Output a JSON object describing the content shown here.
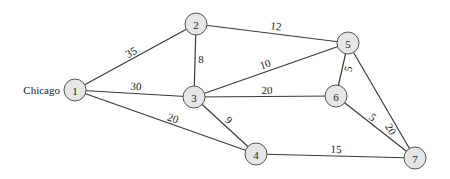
{
  "diagram": {
    "type": "weighted-undirected-graph",
    "node_radius": 11,
    "colors": {
      "node_fill": "#e6e6e6",
      "node_stroke": "#555555",
      "edge": "#3a3a3a",
      "text": "#222222"
    },
    "nodes": [
      {
        "id": "1",
        "label": "1",
        "x": 75,
        "y": 90,
        "name": "Chicago"
      },
      {
        "id": "2",
        "label": "2",
        "x": 196,
        "y": 24
      },
      {
        "id": "3",
        "label": "3",
        "x": 194,
        "y": 97
      },
      {
        "id": "4",
        "label": "4",
        "x": 256,
        "y": 154
      },
      {
        "id": "5",
        "label": "5",
        "x": 348,
        "y": 43
      },
      {
        "id": "6",
        "label": "6",
        "x": 336,
        "y": 96
      },
      {
        "id": "7",
        "label": "7",
        "x": 415,
        "y": 158
      }
    ],
    "edges": [
      {
        "from": "1",
        "to": "2",
        "weight": "35",
        "lx": 131,
        "ly": 52
      },
      {
        "from": "1",
        "to": "3",
        "weight": "30",
        "lx": 136,
        "ly": 86
      },
      {
        "from": "1",
        "to": "4",
        "weight": "20",
        "lx": 173,
        "ly": 118
      },
      {
        "from": "2",
        "to": "3",
        "weight": "8",
        "lx": 201,
        "ly": 59
      },
      {
        "from": "2",
        "to": "5",
        "weight": "12",
        "lx": 276,
        "ly": 26
      },
      {
        "from": "3",
        "to": "5",
        "weight": "10",
        "lx": 265,
        "ly": 64
      },
      {
        "from": "3",
        "to": "6",
        "weight": "20",
        "lx": 267,
        "ly": 90
      },
      {
        "from": "3",
        "to": "4",
        "weight": "9",
        "lx": 229,
        "ly": 120
      },
      {
        "from": "5",
        "to": "6",
        "weight": "5",
        "lx": 348,
        "ly": 69
      },
      {
        "from": "5",
        "to": "7",
        "weight": "20",
        "lx": 391,
        "ly": 129
      },
      {
        "from": "6",
        "to": "7",
        "weight": "5",
        "lx": 373,
        "ly": 117
      },
      {
        "from": "4",
        "to": "7",
        "weight": "15",
        "lx": 336,
        "ly": 149
      }
    ],
    "city_label": {
      "text": "Chicago",
      "node": "1"
    }
  }
}
